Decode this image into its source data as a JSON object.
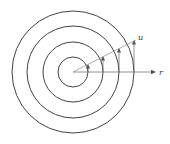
{
  "diagram": {
    "type": "concentric-circles-with-vectors",
    "center": [
      73,
      72
    ],
    "circle_radii": [
      15,
      30,
      46,
      61
    ],
    "labels": {
      "ray": "u",
      "axis": "r"
    },
    "colors": {
      "stroke": "#444444",
      "background": "#ffffff"
    }
  }
}
